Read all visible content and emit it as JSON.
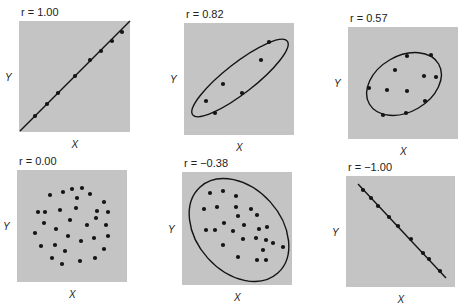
{
  "chart_data": [
    {
      "type": "scatter",
      "title": "r = 1.00",
      "xlabel": "X",
      "ylabel": "Y",
      "panel": {
        "x": 19,
        "y": 21,
        "w": 111,
        "h": 111
      },
      "fit_line": [
        [
          20,
          131
        ],
        [
          130,
          21
        ]
      ],
      "points": [
        [
          35,
          116
        ],
        [
          47,
          104
        ],
        [
          58,
          93
        ],
        [
          75,
          76
        ],
        [
          90,
          60
        ],
        [
          101,
          51
        ],
        [
          112,
          41
        ],
        [
          122,
          32
        ]
      ]
    },
    {
      "type": "scatter",
      "title": "r = 0.82",
      "xlabel": "X",
      "ylabel": "Y",
      "panel": {
        "x": 184,
        "y": 23,
        "w": 110,
        "h": 112
      },
      "ellipse": {
        "cx": 240,
        "cy": 78,
        "rx": 60,
        "ry": 15,
        "rotate": -38
      },
      "points": [
        [
          269,
          42
        ],
        [
          261,
          60
        ],
        [
          223,
          84
        ],
        [
          242,
          93
        ],
        [
          206,
          101
        ],
        [
          215,
          113
        ]
      ]
    },
    {
      "type": "scatter",
      "title": "r = 0.57",
      "xlabel": "X",
      "ylabel": "Y",
      "panel": {
        "x": 348,
        "y": 27,
        "w": 110,
        "h": 112
      },
      "ellipse": {
        "cx": 404,
        "cy": 84,
        "rx": 40,
        "ry": 28,
        "rotate": -30
      },
      "points": [
        [
          407,
          56
        ],
        [
          431,
          55
        ],
        [
          395,
          70
        ],
        [
          424,
          76
        ],
        [
          436,
          77
        ],
        [
          369,
          88
        ],
        [
          387,
          90
        ],
        [
          407,
          91
        ],
        [
          425,
          101
        ],
        [
          383,
          115
        ],
        [
          406,
          113
        ]
      ]
    },
    {
      "type": "scatter",
      "title": "r = 0.00",
      "xlabel": "X",
      "ylabel": "Y",
      "panel": {
        "x": 17,
        "y": 170,
        "w": 110,
        "h": 112
      },
      "points": [
        [
          50,
          195
        ],
        [
          63,
          192
        ],
        [
          72,
          189
        ],
        [
          82,
          188
        ],
        [
          45,
          212
        ],
        [
          77,
          198
        ],
        [
          90,
          194
        ],
        [
          104,
          202
        ],
        [
          38,
          212
        ],
        [
          60,
          210
        ],
        [
          76,
          208
        ],
        [
          97,
          211
        ],
        [
          108,
          212
        ],
        [
          44,
          223
        ],
        [
          70,
          220
        ],
        [
          96,
          218
        ],
        [
          106,
          225
        ],
        [
          56,
          229
        ],
        [
          87,
          225
        ],
        [
          35,
          233
        ],
        [
          68,
          236
        ],
        [
          94,
          238
        ],
        [
          108,
          236
        ],
        [
          41,
          246
        ],
        [
          55,
          245
        ],
        [
          81,
          241
        ],
        [
          104,
          249
        ],
        [
          52,
          258
        ],
        [
          65,
          251
        ],
        [
          80,
          261
        ],
        [
          95,
          258
        ],
        [
          62,
          264
        ]
      ]
    },
    {
      "type": "scatter",
      "title": "r = -0.38",
      "xlabel": "X",
      "ylabel": "Y",
      "panel": {
        "x": 182,
        "y": 172,
        "w": 110,
        "h": 113
      },
      "ellipse": {
        "cx": 239,
        "cy": 230,
        "rx": 58,
        "ry": 42,
        "rotate": 48
      },
      "points": [
        [
          210,
          193
        ],
        [
          223,
          191
        ],
        [
          236,
          196
        ],
        [
          204,
          209
        ],
        [
          217,
          207
        ],
        [
          236,
          207
        ],
        [
          251,
          209
        ],
        [
          238,
          216
        ],
        [
          257,
          215
        ],
        [
          224,
          223
        ],
        [
          244,
          225
        ],
        [
          206,
          230
        ],
        [
          215,
          230
        ],
        [
          233,
          231
        ],
        [
          259,
          229
        ],
        [
          267,
          227
        ],
        [
          243,
          239
        ],
        [
          256,
          238
        ],
        [
          266,
          240
        ],
        [
          223,
          245
        ],
        [
          273,
          243
        ],
        [
          283,
          247
        ],
        [
          263,
          250
        ],
        [
          238,
          257
        ],
        [
          257,
          260
        ],
        [
          266,
          260
        ]
      ]
    },
    {
      "type": "scatter",
      "title": "r = -1.00",
      "xlabel": "X",
      "ylabel": "Y",
      "panel": {
        "x": 346,
        "y": 176,
        "w": 109,
        "h": 111
      },
      "fit_line": [
        [
          358,
          184
        ],
        [
          446,
          278
        ]
      ],
      "points": [
        [
          363,
          190
        ],
        [
          371,
          198
        ],
        [
          378,
          206
        ],
        [
          389,
          217
        ],
        [
          398,
          226
        ],
        [
          411,
          239
        ],
        [
          423,
          253
        ],
        [
          429,
          259
        ],
        [
          440,
          271
        ]
      ]
    }
  ],
  "colors": {
    "panel_bg": "#c4c4c4",
    "ink": "#141414",
    "page_bg": "#ffffff"
  }
}
